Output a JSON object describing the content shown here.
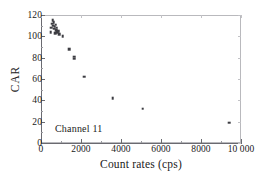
{
  "chart_data": {
    "type": "scatter",
    "title": "",
    "xlabel": "Count rates (cps)",
    "ylabel": "CAR",
    "xlim": [
      0,
      10000
    ],
    "ylim": [
      0,
      120
    ],
    "xticks": [
      0,
      2000,
      4000,
      6000,
      8000,
      10000
    ],
    "xticklabels": [
      "0",
      "2000",
      "4000",
      "6000",
      "8000",
      "10 000"
    ],
    "yticks": [
      0,
      20,
      40,
      60,
      80,
      100,
      120
    ],
    "yticklabels": [
      "0",
      "20",
      "40",
      "60",
      "80",
      "100",
      "120"
    ],
    "grid": false,
    "legend": null,
    "annotations": [
      {
        "text": "Channel 11",
        "x": 700,
        "y": 13
      }
    ],
    "series": [
      {
        "name": "Channel 11",
        "marker": "square",
        "color": "#3c3c42",
        "points": [
          {
            "x": 480,
            "y": 104
          },
          {
            "x": 520,
            "y": 108
          },
          {
            "x": 560,
            "y": 112
          },
          {
            "x": 590,
            "y": 115
          },
          {
            "x": 600,
            "y": 110
          },
          {
            "x": 640,
            "y": 113
          },
          {
            "x": 660,
            "y": 107
          },
          {
            "x": 690,
            "y": 109
          },
          {
            "x": 700,
            "y": 103
          },
          {
            "x": 730,
            "y": 111
          },
          {
            "x": 760,
            "y": 106
          },
          {
            "x": 790,
            "y": 108
          },
          {
            "x": 820,
            "y": 104
          },
          {
            "x": 860,
            "y": 105
          },
          {
            "x": 900,
            "y": 102
          },
          {
            "x": 1080,
            "y": 100
          },
          {
            "x": 1400,
            "y": 88
          },
          {
            "x": 1650,
            "y": 81
          },
          {
            "x": 1660,
            "y": 79
          },
          {
            "x": 2150,
            "y": 62
          },
          {
            "x": 3580,
            "y": 42
          },
          {
            "x": 5080,
            "y": 32
          },
          {
            "x": 9400,
            "y": 19
          }
        ]
      }
    ]
  },
  "figure": {
    "background_color": "#ffffff",
    "axis_color": "#6a6a70",
    "frame_color": "#b9b9bd",
    "marker_color": "#3c3c42"
  }
}
